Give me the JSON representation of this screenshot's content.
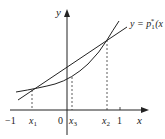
{
  "diagram": {
    "axes": {
      "x_label": "x",
      "y_label": "y",
      "origin_label": "0"
    },
    "x_ticks": [
      {
        "label": "−1",
        "sub": ""
      },
      {
        "label": "x",
        "sub": "1"
      },
      {
        "label": "x",
        "sub": "3"
      },
      {
        "label": "x",
        "sub": "2"
      },
      {
        "label": "1",
        "sub": ""
      }
    ],
    "line_label": {
      "prefix": "y = p",
      "sub": "1",
      "sup": "*",
      "suffix": "(x"
    },
    "colors": {
      "stroke": "#222222",
      "dashed": "#333333"
    }
  }
}
